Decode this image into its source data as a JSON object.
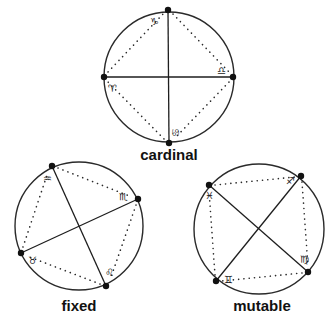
{
  "diagrams": [
    {
      "label": "cardinal",
      "center": [
        169,
        77
      ],
      "radius": 65,
      "points": [
        {
          "x": 168,
          "y": 10,
          "sign": "capricorn",
          "glyph": "♑"
        },
        {
          "x": 233,
          "y": 77,
          "sign": "libra",
          "glyph": "♎"
        },
        {
          "x": 169,
          "y": 143,
          "sign": "cancer",
          "glyph": "♋"
        },
        {
          "x": 104,
          "y": 77,
          "sign": "aries",
          "glyph": "♈"
        }
      ],
      "axes": [
        [
          0,
          2
        ],
        [
          1,
          3
        ]
      ]
    },
    {
      "label": "fixed",
      "center": [
        79,
        226
      ],
      "radius": 64,
      "points": [
        {
          "x": 52,
          "y": 166,
          "sign": "aquarius",
          "glyph": "♒"
        },
        {
          "x": 138,
          "y": 199,
          "sign": "scorpio",
          "glyph": "♏"
        },
        {
          "x": 106,
          "y": 286,
          "sign": "leo",
          "glyph": "♌"
        },
        {
          "x": 21,
          "y": 253,
          "sign": "taurus",
          "glyph": "♉"
        }
      ],
      "axes": [
        [
          0,
          2
        ],
        [
          1,
          3
        ]
      ]
    },
    {
      "label": "mutable",
      "center": [
        259,
        229
      ],
      "radius": 65,
      "points": [
        {
          "x": 301,
          "y": 176,
          "sign": "sagittarius",
          "glyph": "♐"
        },
        {
          "x": 308,
          "y": 272,
          "sign": "virgo",
          "glyph": "♍"
        },
        {
          "x": 216,
          "y": 281,
          "sign": "gemini",
          "glyph": "♊"
        },
        {
          "x": 209,
          "y": 185,
          "sign": "pisces",
          "glyph": "♓"
        }
      ],
      "axes": [
        [
          0,
          2
        ],
        [
          1,
          3
        ]
      ]
    }
  ],
  "labels": {
    "cardinal": "cardinal",
    "fixed": "fixed",
    "mutable": "mutable"
  },
  "glyphs": {
    "capricorn": "♑",
    "libra": "♎",
    "cancer": "♋",
    "aries": "♈",
    "aquarius": "♒",
    "scorpio": "♏",
    "leo": "♌",
    "taurus": "♉",
    "sagittarius": "♐",
    "virgo": "♍",
    "gemini": "♊",
    "pisces": "♓"
  }
}
